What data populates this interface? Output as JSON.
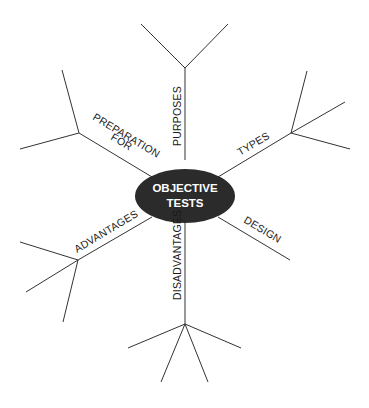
{
  "diagram": {
    "type": "mind-map",
    "center": {
      "line1": "OBJECTIVE",
      "line2": "TESTS",
      "fill": "#2b2b2b",
      "text_color": "#ffffff"
    },
    "branches": [
      {
        "id": "purposes",
        "label": "PURPOSES",
        "sub_branches": 2
      },
      {
        "id": "types",
        "label": "TYPES",
        "sub_branches": 3
      },
      {
        "id": "design",
        "label": "DESIGN",
        "sub_branches": 0
      },
      {
        "id": "disadvantages",
        "label": "DISADVANTAGES",
        "sub_branches": 4
      },
      {
        "id": "advantages",
        "label": "ADVANTAGES",
        "sub_branches": 3
      },
      {
        "id": "preparation",
        "label1": "PREPARATION",
        "label2": "FOR",
        "sub_branches": 2
      }
    ],
    "line_color": "#333333"
  }
}
